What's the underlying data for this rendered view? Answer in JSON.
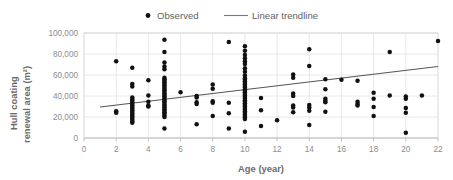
{
  "chart_data": {
    "type": "scatter",
    "title": "",
    "xlabel": "Age (year)",
    "ylabel": "Hull coating renewal area (m²)",
    "xlim": [
      0,
      22
    ],
    "ylim": [
      0,
      100000
    ],
    "xticks": [
      0,
      2,
      4,
      6,
      8,
      10,
      12,
      14,
      16,
      18,
      20,
      22
    ],
    "xtick_labels": [
      "0",
      "2",
      "4",
      "6",
      "8",
      "10",
      "12",
      "14",
      "16",
      "18",
      "20",
      "22"
    ],
    "yticks": [
      0,
      20000,
      40000,
      60000,
      80000,
      100000
    ],
    "ytick_labels": [
      "0",
      "20,000",
      "40,000",
      "60,000",
      "80,000",
      "100,000"
    ],
    "grid": "horizontal-and-vertical",
    "legend_position": "top-center",
    "legend": [
      {
        "label": "Observed",
        "marker": "dot",
        "color": "#111111"
      },
      {
        "label": "Linear trendline",
        "marker": "line",
        "color": "#777777"
      }
    ],
    "series": [
      {
        "name": "Observed",
        "marker": "dot",
        "color": "#111111",
        "points": [
          [
            2,
            73000
          ],
          [
            2,
            25500
          ],
          [
            2,
            24000
          ],
          [
            3,
            67000
          ],
          [
            3,
            51500
          ],
          [
            3,
            49000
          ],
          [
            3,
            38500
          ],
          [
            3,
            37000
          ],
          [
            3,
            35500
          ],
          [
            3,
            34000
          ],
          [
            3,
            32500
          ],
          [
            3,
            31000
          ],
          [
            3,
            29500
          ],
          [
            3,
            28000
          ],
          [
            3,
            26500
          ],
          [
            3,
            25000
          ],
          [
            3,
            23500
          ],
          [
            3,
            22000
          ],
          [
            3,
            20500
          ],
          [
            3,
            19000
          ],
          [
            3,
            17500
          ],
          [
            3,
            16000
          ],
          [
            3,
            14500
          ],
          [
            4,
            55000
          ],
          [
            4,
            40500
          ],
          [
            4,
            34500
          ],
          [
            4,
            31000
          ],
          [
            4,
            30000
          ],
          [
            5,
            93500
          ],
          [
            5,
            82000
          ],
          [
            5,
            72000
          ],
          [
            5,
            68000
          ],
          [
            5,
            65500
          ],
          [
            5,
            57500
          ],
          [
            5,
            56000
          ],
          [
            5,
            54500
          ],
          [
            5,
            53000
          ],
          [
            5,
            51500
          ],
          [
            5,
            50000
          ],
          [
            5,
            48500
          ],
          [
            5,
            47000
          ],
          [
            5,
            45500
          ],
          [
            5,
            44000
          ],
          [
            5,
            42500
          ],
          [
            5,
            41000
          ],
          [
            5,
            39500
          ],
          [
            5,
            38000
          ],
          [
            5,
            36500
          ],
          [
            5,
            35000
          ],
          [
            5,
            33500
          ],
          [
            5,
            32000
          ],
          [
            5,
            30500
          ],
          [
            5,
            29000
          ],
          [
            5,
            27500
          ],
          [
            5,
            26000
          ],
          [
            5,
            24500
          ],
          [
            5,
            23000
          ],
          [
            5,
            21500
          ],
          [
            5,
            20000
          ],
          [
            5,
            9000
          ],
          [
            6,
            43500
          ],
          [
            7,
            40000
          ],
          [
            7,
            38500
          ],
          [
            7,
            34000
          ],
          [
            7,
            32500
          ],
          [
            7,
            13000
          ],
          [
            8,
            51000
          ],
          [
            8,
            47000
          ],
          [
            8,
            35000
          ],
          [
            8,
            33500
          ],
          [
            8,
            21000
          ],
          [
            9,
            91500
          ],
          [
            9,
            33500
          ],
          [
            9,
            23500
          ],
          [
            9,
            9000
          ],
          [
            10,
            87500
          ],
          [
            10,
            83000
          ],
          [
            10,
            79000
          ],
          [
            10,
            76000
          ],
          [
            10,
            73000
          ],
          [
            10,
            70500
          ],
          [
            10,
            66500
          ],
          [
            10,
            63000
          ],
          [
            10,
            59500
          ],
          [
            10,
            57000
          ],
          [
            10,
            55500
          ],
          [
            10,
            54000
          ],
          [
            10,
            52500
          ],
          [
            10,
            51000
          ],
          [
            10,
            49500
          ],
          [
            10,
            48000
          ],
          [
            10,
            46500
          ],
          [
            10,
            45000
          ],
          [
            10,
            43500
          ],
          [
            10,
            42000
          ],
          [
            10,
            40500
          ],
          [
            10,
            39000
          ],
          [
            10,
            37500
          ],
          [
            10,
            36000
          ],
          [
            10,
            34500
          ],
          [
            10,
            33000
          ],
          [
            10,
            31500
          ],
          [
            10,
            30000
          ],
          [
            10,
            28500
          ],
          [
            10,
            27000
          ],
          [
            10,
            25500
          ],
          [
            10,
            24000
          ],
          [
            10,
            22500
          ],
          [
            10,
            21000
          ],
          [
            10,
            19500
          ],
          [
            10,
            18000
          ],
          [
            10,
            6000
          ],
          [
            11,
            38000
          ],
          [
            11,
            26500
          ],
          [
            11,
            11500
          ],
          [
            12,
            17000
          ],
          [
            13,
            60500
          ],
          [
            13,
            57500
          ],
          [
            13,
            42500
          ],
          [
            13,
            40000
          ],
          [
            13,
            31000
          ],
          [
            13,
            29000
          ],
          [
            13,
            24500
          ],
          [
            14,
            84500
          ],
          [
            14,
            68500
          ],
          [
            14,
            31500
          ],
          [
            14,
            29000
          ],
          [
            14,
            26000
          ],
          [
            14,
            12500
          ],
          [
            15,
            56000
          ],
          [
            15,
            46500
          ],
          [
            15,
            37500
          ],
          [
            15,
            35500
          ],
          [
            15,
            34000
          ],
          [
            15,
            25000
          ],
          [
            16,
            55500
          ],
          [
            17,
            54500
          ],
          [
            17,
            34500
          ],
          [
            17,
            32500
          ],
          [
            17,
            31000
          ],
          [
            18,
            43000
          ],
          [
            18,
            37500
          ],
          [
            18,
            29500
          ],
          [
            18,
            21000
          ],
          [
            19,
            82000
          ],
          [
            19,
            40500
          ],
          [
            20,
            39500
          ],
          [
            20,
            37500
          ],
          [
            20,
            28500
          ],
          [
            20,
            24000
          ],
          [
            20,
            5000
          ],
          [
            21,
            40500
          ],
          [
            22,
            92500
          ]
        ]
      },
      {
        "name": "Linear trendline",
        "type": "line",
        "color": "#555555",
        "endpoints": [
          [
            1,
            29500
          ],
          [
            22,
            68000
          ]
        ],
        "slope": 1833,
        "intercept": 27667
      }
    ]
  }
}
